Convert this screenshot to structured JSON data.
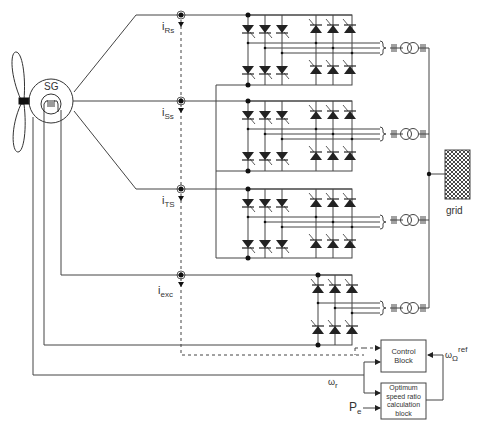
{
  "diagram": {
    "generator": {
      "label": "SG"
    },
    "currents": [
      {
        "id": "iRs",
        "main": "i",
        "sub": "Rs"
      },
      {
        "id": "iSs",
        "main": "i",
        "sub": "Ss"
      },
      {
        "id": "iTS",
        "main": "i",
        "sub": "TS"
      },
      {
        "id": "iexc",
        "main": "i",
        "sub": "exc"
      }
    ],
    "grid": {
      "label": "grid"
    },
    "control_block": {
      "line1": "Control",
      "line2": "Block"
    },
    "optimum_block": {
      "line1": "Optimum",
      "line2": "speed ratio",
      "line3": "calculation",
      "line4": "block"
    },
    "signals": {
      "omega_r": {
        "main": "ω",
        "sub": "r"
      },
      "omega_ref": {
        "main": "ω",
        "sub": "Ω",
        "sup": "ref"
      },
      "pe": {
        "main": "P",
        "sub": "e"
      }
    },
    "converters": [
      {
        "name": "converter-R",
        "type": "thyristor bridge pair"
      },
      {
        "name": "converter-S",
        "type": "thyristor bridge pair"
      },
      {
        "name": "converter-T",
        "type": "thyristor bridge pair"
      },
      {
        "name": "converter-exc",
        "type": "thyristor bridge"
      }
    ],
    "colors": {
      "line": "#333333",
      "dashed": "#444444",
      "background": "#ffffff"
    }
  }
}
